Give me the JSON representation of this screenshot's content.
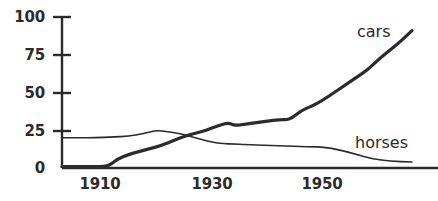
{
  "chart_data": {
    "type": "line",
    "title": "",
    "xlabel": "",
    "ylabel": "",
    "xlim": [
      1903,
      1966
    ],
    "ylim": [
      0,
      100
    ],
    "grid": false,
    "legend_position": "inline-right",
    "xticks": [
      1910,
      1930,
      1950
    ],
    "xtick_labels": [
      "1910",
      "1930",
      "1950"
    ],
    "yticks": [
      0,
      25,
      50,
      75,
      100
    ],
    "ytick_labels": [
      "0",
      "25",
      "50",
      "75",
      "100"
    ],
    "series": [
      {
        "name": "cars",
        "label": "cars",
        "color": "#2b2b2b",
        "line_width": 3.2,
        "x": [
          1903,
          1906,
          1909,
          1911,
          1912,
          1913,
          1915,
          1917,
          1919,
          1921,
          1923,
          1925,
          1927,
          1929,
          1931,
          1933,
          1934,
          1936,
          1938,
          1940,
          1942,
          1944,
          1946,
          1948,
          1950,
          1952,
          1954,
          1956,
          1958,
          1960,
          1962,
          1964,
          1966
        ],
        "y": [
          1,
          1,
          1,
          1,
          3,
          6,
          9,
          11,
          13,
          15,
          18,
          21,
          23,
          25,
          28,
          30,
          28,
          29,
          30,
          31,
          32,
          32,
          38,
          41,
          45,
          50,
          55,
          60,
          65,
          72,
          78,
          84,
          91
        ]
      },
      {
        "name": "horses",
        "label": "horses",
        "color": "#2b2b2b",
        "line_width": 1.6,
        "x": [
          1903,
          1906,
          1909,
          1912,
          1915,
          1918,
          1920,
          1922,
          1924,
          1926,
          1928,
          1930,
          1932,
          1934,
          1936,
          1940,
          1944,
          1948,
          1950,
          1953,
          1956,
          1959,
          1962,
          1966
        ],
        "y": [
          20,
          20,
          20,
          20.5,
          21,
          23,
          25,
          24,
          23,
          21,
          19,
          17,
          16,
          16,
          15.5,
          15,
          14.5,
          14,
          14,
          12,
          9,
          6,
          4.5,
          4
        ]
      }
    ],
    "annotations": [
      {
        "text": "cars",
        "x_px": 357,
        "y_px": 22
      },
      {
        "text": "horses",
        "x_px": 355,
        "y_px": 133
      }
    ],
    "axis": {
      "color": "#2b2b2b",
      "x_axis_px": {
        "x1": 62,
        "x2": 438,
        "y": 168
      },
      "y_axis_px": {
        "x": 62,
        "y1": 17,
        "y2": 168
      }
    }
  },
  "labels": {
    "y_100": "100",
    "y_75": "75",
    "y_50": "50",
    "y_25": "25",
    "y_0": "0",
    "x_1910": "1910",
    "x_1930": "1930",
    "x_1950": "1950",
    "cars": "cars",
    "horses": "horses"
  }
}
